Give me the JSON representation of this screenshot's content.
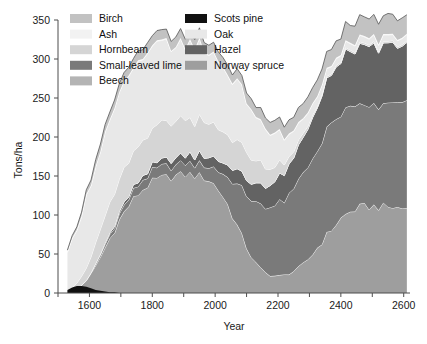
{
  "chart_data": {
    "type": "area",
    "stacked": true,
    "title": "",
    "xlabel": "Year",
    "ylabel": "Tons/ha",
    "xlim": [
      1500,
      2620
    ],
    "ylim": [
      0,
      350
    ],
    "xticks": [
      1600,
      1800,
      2000,
      2200,
      2400,
      2600
    ],
    "xticklabels": [
      "1600",
      "1800",
      "2000",
      "2200",
      "2400",
      "2600"
    ],
    "xminorticks": [
      1500,
      1700,
      1900,
      2100,
      2300,
      2500
    ],
    "yticks": [
      0,
      50,
      100,
      150,
      200,
      250,
      300,
      350
    ],
    "yticklabels": [
      "0",
      "50",
      "100",
      "150",
      "200",
      "250",
      "300",
      "350"
    ],
    "grid": false,
    "legend_position": "top-left-inside",
    "x": [
      1530,
      1545,
      1560,
      1575,
      1590,
      1605,
      1620,
      1635,
      1650,
      1665,
      1680,
      1695,
      1710,
      1725,
      1740,
      1755,
      1770,
      1785,
      1800,
      1815,
      1830,
      1845,
      1860,
      1875,
      1890,
      1905,
      1920,
      1935,
      1950,
      1965,
      1980,
      1995,
      2010,
      2025,
      2040,
      2055,
      2070,
      2085,
      2100,
      2115,
      2130,
      2145,
      2160,
      2175,
      2190,
      2205,
      2220,
      2235,
      2250,
      2265,
      2280,
      2295,
      2310,
      2325,
      2340,
      2355,
      2370,
      2385,
      2400,
      2415,
      2430,
      2445,
      2460,
      2475,
      2490,
      2505,
      2520,
      2535,
      2550,
      2565,
      2580,
      2595,
      2610
    ],
    "series": [
      {
        "name": "Norway spruce",
        "color": "#9e9e9e",
        "values": [
          1,
          3,
          6,
          10,
          16,
          24,
          34,
          46,
          58,
          70,
          82,
          93,
          103,
          112,
          120,
          127,
          133,
          138,
          142,
          145,
          147,
          148,
          149,
          150,
          151,
          152,
          152,
          151,
          150,
          148,
          145,
          140,
          133,
          124,
          113,
          100,
          86,
          72,
          59,
          47,
          38,
          31,
          26,
          23,
          22,
          22,
          23,
          25,
          28,
          32,
          37,
          43,
          50,
          58,
          66,
          74,
          82,
          89,
          95,
          100,
          104,
          107,
          109,
          110,
          111,
          111,
          111,
          110,
          110,
          110,
          109,
          109,
          109
        ]
      },
      {
        "name": "Small-leaved lime",
        "color": "#7a7a7a",
        "values": [
          0,
          0,
          0,
          0,
          1,
          1,
          2,
          3,
          4,
          5,
          6,
          7,
          8,
          9,
          10,
          11,
          12,
          12,
          13,
          13,
          14,
          14,
          14,
          14,
          14,
          14,
          14,
          14,
          15,
          16,
          18,
          21,
          25,
          30,
          36,
          43,
          51,
          59,
          67,
          73,
          79,
          83,
          86,
          88,
          90,
          92,
          95,
          99,
          104,
          109,
          114,
          119,
          124,
          128,
          131,
          133,
          134,
          134,
          133,
          132,
          131,
          130,
          129,
          128,
          128,
          128,
          129,
          130,
          131,
          132,
          133,
          134,
          135
        ]
      },
      {
        "name": "Hazel",
        "color": "#636363"
      },
      {
        "name": "Beech",
        "color": "#b4b4b4",
        "values": [
          0,
          0,
          0,
          0,
          0,
          0,
          0,
          0,
          0,
          0,
          0,
          0,
          0,
          0,
          0,
          0,
          0,
          0,
          0,
          0,
          0,
          0,
          0,
          0,
          0,
          0,
          0,
          0,
          0,
          0,
          0,
          0,
          0,
          0,
          0,
          0,
          0,
          0,
          0,
          0,
          0,
          0,
          0,
          0,
          0,
          0,
          0,
          0,
          0,
          0,
          0,
          0,
          0,
          0,
          0,
          0,
          0,
          0,
          0,
          0,
          0,
          0,
          0,
          0,
          0,
          0,
          0,
          0,
          0,
          0,
          0,
          0,
          0
        ]
      },
      {
        "name": "Hornbeam",
        "color": "#d5d5d5",
        "values": [
          2,
          4,
          7,
          11,
          16,
          21,
          26,
          30,
          34,
          37,
          39,
          41,
          42,
          43,
          44,
          45,
          45,
          46,
          46,
          46,
          46,
          46,
          46,
          46,
          46,
          46,
          45,
          45,
          44,
          43,
          42,
          41,
          40,
          39,
          38,
          37,
          36,
          35,
          34,
          32,
          30,
          28,
          25,
          22,
          19,
          16,
          13,
          10,
          8,
          6,
          5,
          4,
          3,
          2,
          2,
          2,
          2,
          2,
          2,
          2,
          2,
          2,
          2,
          2,
          2,
          2,
          2,
          2,
          2,
          2,
          2,
          2,
          2
        ]
      },
      {
        "name": "Oak",
        "color": "#e8e8e8",
        "values": [
          46,
          60,
          72,
          82,
          90,
          96,
          100,
          103,
          105,
          106,
          107,
          107,
          107,
          107,
          106,
          106,
          105,
          104,
          103,
          102,
          101,
          100,
          99,
          98,
          97,
          96,
          95,
          94,
          93,
          92,
          90,
          88,
          86,
          83,
          80,
          77,
          73,
          69,
          65,
          61,
          57,
          53,
          49,
          45,
          41,
          37,
          33,
          29,
          25,
          22,
          19,
          16,
          14,
          12,
          11,
          10,
          9,
          9,
          8,
          8,
          8,
          8,
          8,
          8,
          8,
          8,
          8,
          8,
          8,
          8,
          8,
          8,
          8
        ]
      },
      {
        "name": "Ash",
        "color": "#f2f2f2",
        "values": [
          1,
          1,
          1,
          1,
          1,
          1,
          1,
          1,
          1,
          1,
          1,
          1,
          1,
          1,
          1,
          1,
          1,
          1,
          1,
          1,
          1,
          1,
          1,
          1,
          1,
          1,
          1,
          1,
          1,
          1,
          1,
          1,
          1,
          1,
          1,
          1,
          1,
          1,
          1,
          1,
          1,
          1,
          1,
          1,
          1,
          1,
          1,
          1,
          1,
          1,
          1,
          1,
          1,
          1,
          1,
          1,
          1,
          1,
          1,
          1,
          1,
          1,
          1,
          1,
          1,
          1,
          1,
          1,
          1,
          1,
          1,
          1,
          1
        ]
      },
      {
        "name": "Birch",
        "color": "#c2c2c2",
        "values": [
          2,
          3,
          4,
          5,
          6,
          7,
          8,
          9,
          9,
          10,
          10,
          11,
          11,
          11,
          12,
          12,
          12,
          12,
          12,
          12,
          12,
          12,
          12,
          12,
          12,
          12,
          12,
          12,
          12,
          12,
          12,
          12,
          12,
          12,
          12,
          12,
          12,
          12,
          13,
          13,
          13,
          14,
          14,
          15,
          15,
          16,
          16,
          17,
          17,
          18,
          18,
          19,
          19,
          20,
          20,
          21,
          21,
          22,
          22,
          23,
          23,
          24,
          24,
          24,
          25,
          25,
          25,
          25,
          25,
          25,
          25,
          25,
          25
        ]
      },
      {
        "name": "Scots pine",
        "color": "#111111",
        "values": [
          4,
          7,
          9,
          9,
          8,
          6,
          4,
          3,
          2,
          1,
          1,
          0,
          0,
          0,
          0,
          0,
          0,
          0,
          0,
          0,
          0,
          0,
          0,
          0,
          0,
          0,
          0,
          0,
          0,
          0,
          0,
          0,
          0,
          0,
          0,
          0,
          0,
          0,
          0,
          0,
          0,
          0,
          0,
          0,
          0,
          0,
          0,
          0,
          0,
          0,
          0,
          0,
          0,
          0,
          0,
          0,
          0,
          0,
          0,
          0,
          0,
          0,
          0,
          0,
          0,
          0,
          0,
          0,
          0,
          0,
          0,
          0,
          0
        ]
      }
    ],
    "hazel_values": [
      0,
      0,
      0,
      0,
      0,
      0,
      1,
      1,
      2,
      2,
      3,
      3,
      4,
      4,
      5,
      5,
      6,
      6,
      7,
      7,
      8,
      8,
      9,
      9,
      10,
      10,
      11,
      11,
      12,
      12,
      13,
      13,
      14,
      15,
      16,
      17,
      18,
      19,
      20,
      22,
      24,
      26,
      28,
      30,
      32,
      34,
      36,
      38,
      40,
      43,
      46,
      49,
      52,
      55,
      58,
      61,
      64,
      66,
      68,
      70,
      71,
      72,
      73,
      73,
      74,
      74,
      74,
      74,
      74,
      74,
      74,
      74,
      74
    ],
    "stack_order_bottom_to_top": [
      "Norway spruce",
      "Small-leaved lime",
      "Hazel",
      "Beech",
      "Hornbeam",
      "Oak",
      "Ash",
      "Birch"
    ]
  },
  "legend": {
    "columns": [
      {
        "items": [
          {
            "label": "Birch",
            "color": "#c2c2c2"
          },
          {
            "label": "Ash",
            "color": "#f2f2f2"
          },
          {
            "label": "Hornbeam",
            "color": "#d5d5d5"
          },
          {
            "label": "Small-leaved lime",
            "color": "#7a7a7a"
          },
          {
            "label": "Beech",
            "color": "#b4b4b4"
          }
        ]
      },
      {
        "items": [
          {
            "label": "Scots pine",
            "color": "#111111"
          },
          {
            "label": "Oak",
            "color": "#e8e8e8"
          },
          {
            "label": "Hazel",
            "color": "#636363"
          },
          {
            "label": "Norway spruce",
            "color": "#9e9e9e"
          }
        ]
      }
    ]
  },
  "axes": {
    "y_title": "Tons/ha",
    "x_title": "Year",
    "y_ticklabels": [
      "350",
      "300",
      "250",
      "200",
      "150",
      "100",
      "50",
      "0"
    ],
    "x_ticklabels": [
      "1600",
      "1800",
      "2000",
      "2200",
      "2400",
      "2600"
    ]
  }
}
